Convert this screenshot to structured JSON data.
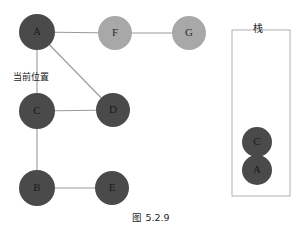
{
  "figure": {
    "caption": "图 5.2.9",
    "annotation_label": "当前位置",
    "stack_title": "栈"
  },
  "colors": {
    "node_dark": "#4a4a4a",
    "node_light": "#a8a8a8",
    "edge": "#9a9a9a",
    "box_border": "#b0b0b0",
    "text": "#1c1c1c",
    "background": "#ffffff"
  },
  "graph": {
    "nodes": [
      {
        "id": "A",
        "label": "A",
        "cx": 37,
        "cy": 32,
        "r": 18,
        "shade": "dark"
      },
      {
        "id": "F",
        "label": "F",
        "cx": 115,
        "cy": 33,
        "r": 17,
        "shade": "light"
      },
      {
        "id": "G",
        "label": "G",
        "cx": 189,
        "cy": 33,
        "r": 17,
        "shade": "light"
      },
      {
        "id": "C",
        "label": "C",
        "cx": 37,
        "cy": 111,
        "r": 18,
        "shade": "dark"
      },
      {
        "id": "D",
        "label": "D",
        "cx": 113,
        "cy": 110,
        "r": 17,
        "shade": "dark"
      },
      {
        "id": "B",
        "label": "B",
        "cx": 37,
        "cy": 188,
        "r": 18,
        "shade": "dark"
      },
      {
        "id": "E",
        "label": "E",
        "cx": 112,
        "cy": 188,
        "r": 17,
        "shade": "dark"
      }
    ],
    "edges": [
      {
        "from": "A",
        "to": "F"
      },
      {
        "from": "F",
        "to": "G"
      },
      {
        "from": "A",
        "to": "C"
      },
      {
        "from": "A",
        "to": "D"
      },
      {
        "from": "C",
        "to": "D"
      },
      {
        "from": "C",
        "to": "B"
      },
      {
        "from": "B",
        "to": "E"
      }
    ]
  },
  "stack": {
    "box": {
      "x": 232,
      "y": 30,
      "width": 58,
      "height": 166
    },
    "items": [
      {
        "label": "C",
        "cx": 257,
        "cy": 142,
        "r": 15,
        "shade": "dark"
      },
      {
        "label": "A",
        "cx": 257,
        "cy": 170,
        "r": 15,
        "shade": "dark"
      }
    ]
  }
}
